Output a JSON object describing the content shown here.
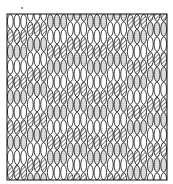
{
  "figure": {
    "frame": {
      "x": 7,
      "y": 14,
      "w": 160,
      "h": 166
    },
    "colors": {
      "ink": "#111111",
      "paper": "#ffffff",
      "stipple": "#777777"
    },
    "columns": 24,
    "rows": 11,
    "fills": [
      "white",
      "hatch",
      "stipple"
    ]
  }
}
